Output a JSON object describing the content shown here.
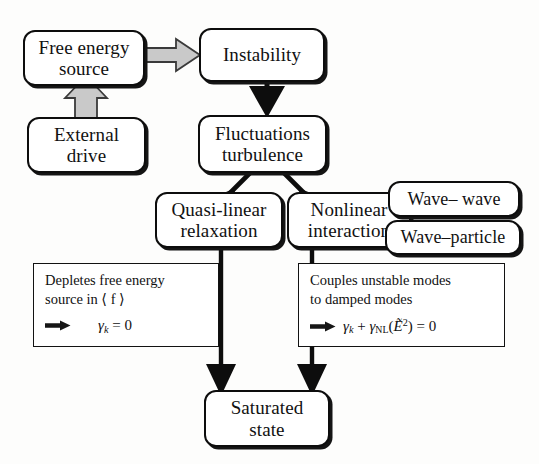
{
  "diagram": {
    "nodes": [
      {
        "id": "free-energy-source",
        "line1": "Free energy",
        "line2": "source"
      },
      {
        "id": "external-drive",
        "line1": "External",
        "line2": "drive"
      },
      {
        "id": "instability",
        "line1": "Instability",
        "line2": ""
      },
      {
        "id": "fluctuations-turbulence",
        "line1": "Fluctuations",
        "line2": "turbulence"
      },
      {
        "id": "quasi-linear-relaxation",
        "line1": "Quasi-linear",
        "line2": "relaxation"
      },
      {
        "id": "nonlinear-interaction",
        "line1": "Nonlinear",
        "line2": "interaction"
      },
      {
        "id": "wave-wave",
        "line1": "Wave– wave",
        "line2": ""
      },
      {
        "id": "wave-particle",
        "line1": "Wave–particle",
        "line2": ""
      },
      {
        "id": "saturated-state",
        "line1": "Saturated",
        "line2": "state"
      }
    ],
    "notes": [
      {
        "id": "quasi-linear-note",
        "line1": "Depletes free energy",
        "line2": "source in ⟨ f ⟩",
        "equation": "⟹   γk = 0"
      },
      {
        "id": "nonlinear-note",
        "line1": "Couples unstable modes",
        "line2": "to damped modes",
        "equation": "⟹ γk + γNL(Ẽ²) = 0"
      }
    ],
    "colors": {
      "ink": "#0d0d0d",
      "page": "#fdfdfc",
      "hollow_arrow_fill": "#c9c9c9",
      "hollow_arrow_stroke": "#3a3a3a"
    },
    "connectors": [
      {
        "id": "free-energy-to-instability",
        "style": "hollow-gray",
        "direction": "right"
      },
      {
        "id": "external-drive-to-free-energy",
        "style": "hollow-gray",
        "direction": "up"
      },
      {
        "id": "instability-to-fluctuations",
        "style": "solid-black",
        "direction": "down"
      },
      {
        "id": "fluctuations-to-quasi-linear",
        "style": "solid-black",
        "direction": "down-left"
      },
      {
        "id": "fluctuations-to-nonlinear",
        "style": "solid-black",
        "direction": "down-right"
      },
      {
        "id": "quasi-linear-to-saturated",
        "style": "solid-black",
        "direction": "down"
      },
      {
        "id": "nonlinear-to-saturated",
        "style": "solid-black",
        "direction": "down"
      }
    ]
  }
}
